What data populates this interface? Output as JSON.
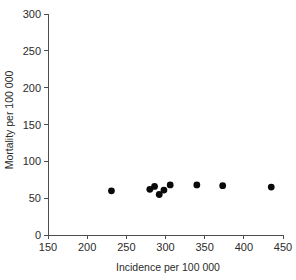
{
  "chart_data": {
    "type": "scatter",
    "title": "",
    "xlabel": "Incidence per 100 000",
    "ylabel": "Mortality per 100 000",
    "xlim": [
      150,
      450
    ],
    "ylim": [
      0,
      300
    ],
    "xticks": [
      150,
      200,
      250,
      300,
      350,
      400,
      450
    ],
    "yticks": [
      0,
      50,
      100,
      150,
      200,
      250,
      300
    ],
    "xtick_labels": [
      "150",
      "200",
      "250",
      "300",
      "350",
      "400",
      "450"
    ],
    "ytick_labels": [
      "0",
      "50",
      "100",
      "150",
      "200",
      "250",
      "300"
    ],
    "grid": false,
    "legend": null,
    "marker": "filled-circle",
    "marker_color": "#0a0a0a",
    "points": [
      {
        "x": 231,
        "y": 60
      },
      {
        "x": 280,
        "y": 62
      },
      {
        "x": 286,
        "y": 66
      },
      {
        "x": 292,
        "y": 55
      },
      {
        "x": 298,
        "y": 61
      },
      {
        "x": 306,
        "y": 68
      },
      {
        "x": 340,
        "y": 68
      },
      {
        "x": 373,
        "y": 67
      },
      {
        "x": 435,
        "y": 65
      }
    ]
  }
}
